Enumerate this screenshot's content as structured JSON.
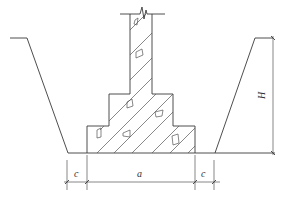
{
  "diagram": {
    "type": "foundation-trench-cross-section",
    "labels": {
      "left_clearance": "c",
      "base_width": "a",
      "right_clearance": "c",
      "depth": "H"
    },
    "components": [
      "trench-slope-left",
      "trench-slope-right",
      "trench-bottom",
      "stepped-foundation-base",
      "stepped-foundation-middle",
      "foundation-column",
      "break-line",
      "dimension-line-horizontal",
      "dimension-line-vertical-depth"
    ],
    "colors": {
      "line": "#3a3a3a",
      "background": "#ffffff"
    }
  }
}
